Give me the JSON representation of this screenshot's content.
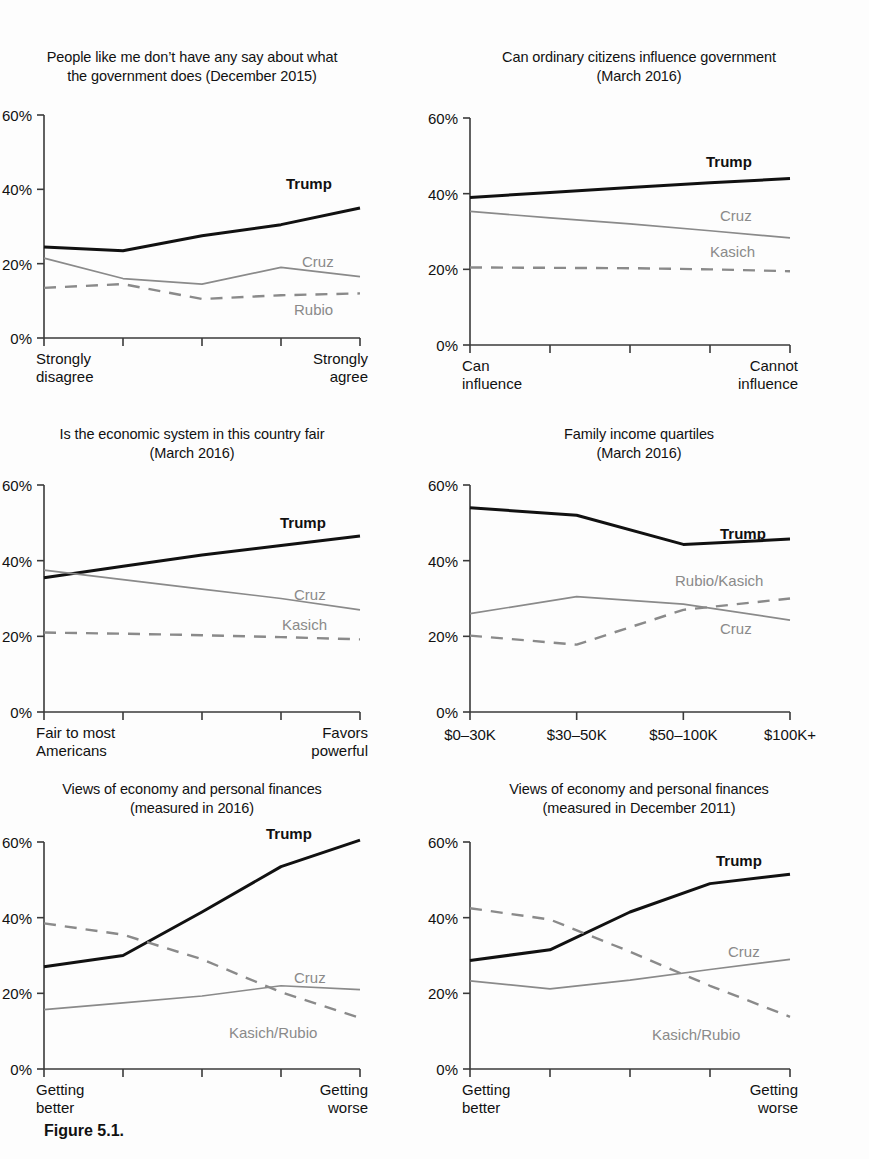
{
  "figure": {
    "caption": "Figure 5.1.",
    "axis": {
      "ticks": [
        "60%",
        "40%",
        "20%",
        "0%"
      ],
      "ymin": 0,
      "ymax": 60
    },
    "colors": {
      "trump": "#111111",
      "gray": "#8a8a8a",
      "axis": "#3a3a3a"
    }
  },
  "chart_data": [
    {
      "id": "panel-say-government",
      "type": "line",
      "title": "People like me don’t have any say about what\nthe government does (December 2015)",
      "xlabel": "",
      "ylabel": "",
      "ylim": [
        0,
        60
      ],
      "ytick_labels": [
        "60%",
        "40%",
        "20%",
        "0%"
      ],
      "ytick_values": [
        60,
        40,
        20,
        0
      ],
      "grid": false,
      "legend_position": "inline-right",
      "x": [
        1,
        2,
        3,
        4,
        5
      ],
      "x_axis_end_labels": {
        "left": "Strongly\ndisagree",
        "right": "Strongly\nagree"
      },
      "series": [
        {
          "name": "Trump",
          "style": "solid-thick",
          "color": "#111111",
          "values": [
            24.5,
            23.5,
            27.5,
            30.5,
            35.0
          ]
        },
        {
          "name": "Cruz",
          "style": "solid-thin",
          "color": "#8a8a8a",
          "values": [
            21.5,
            16.0,
            14.5,
            19.0,
            16.5
          ]
        },
        {
          "name": "Rubio",
          "style": "dashed",
          "color": "#8a8a8a",
          "values": [
            13.5,
            14.5,
            10.5,
            11.5,
            12.0
          ]
        }
      ]
    },
    {
      "id": "panel-ordinary-citizens",
      "type": "line",
      "title": "Can ordinary citizens influence government\n(March 2016)",
      "xlabel": "",
      "ylabel": "",
      "ylim": [
        0,
        60
      ],
      "ytick_labels": [
        "60%",
        "40%",
        "20%",
        "0%"
      ],
      "ytick_values": [
        60,
        40,
        20,
        0
      ],
      "grid": false,
      "legend_position": "inline-right",
      "x": [
        1,
        2,
        3,
        4,
        5
      ],
      "x_axis_end_labels": {
        "left": "Can\ninfluence",
        "right": "Cannot\ninfluence"
      },
      "series": [
        {
          "name": "Trump",
          "style": "solid-thick",
          "color": "#111111",
          "values": [
            39.0,
            40.3,
            41.6,
            42.9,
            44.0
          ]
        },
        {
          "name": "Cruz",
          "style": "solid-thin",
          "color": "#8a8a8a",
          "values": [
            35.3,
            33.6,
            32.0,
            30.2,
            28.3
          ]
        },
        {
          "name": "Kasich",
          "style": "dashed",
          "color": "#8a8a8a",
          "values": [
            20.5,
            20.4,
            20.3,
            20.0,
            19.5
          ]
        }
      ]
    },
    {
      "id": "panel-economic-system-fair",
      "type": "line",
      "title": "Is the economic system in this country fair\n(March 2016)",
      "xlabel": "",
      "ylabel": "",
      "ylim": [
        0,
        60
      ],
      "ytick_labels": [
        "60%",
        "40%",
        "20%",
        "0%"
      ],
      "ytick_values": [
        60,
        40,
        20,
        0
      ],
      "grid": false,
      "legend_position": "inline-right",
      "x": [
        1,
        2,
        3,
        4,
        5
      ],
      "x_axis_end_labels": {
        "left": "Fair to most\nAmericans",
        "right": "Favors\npowerful"
      },
      "series": [
        {
          "name": "Trump",
          "style": "solid-thick",
          "color": "#111111",
          "values": [
            35.5,
            38.5,
            41.5,
            44.0,
            46.5
          ]
        },
        {
          "name": "Cruz",
          "style": "solid-thin",
          "color": "#8a8a8a",
          "values": [
            37.5,
            35.0,
            32.5,
            30.0,
            27.0
          ]
        },
        {
          "name": "Kasich",
          "style": "dashed",
          "color": "#8a8a8a",
          "values": [
            21.0,
            20.7,
            20.3,
            19.8,
            19.2
          ]
        }
      ]
    },
    {
      "id": "panel-family-income",
      "type": "line",
      "title": "Family income quartiles\n(March 2016)",
      "xlabel": "",
      "ylabel": "",
      "ylim": [
        0,
        60
      ],
      "ytick_labels": [
        "60%",
        "40%",
        "20%",
        "0%"
      ],
      "ytick_values": [
        60,
        40,
        20,
        0
      ],
      "grid": false,
      "legend_position": "inline-right",
      "x": [
        1,
        2,
        3,
        4
      ],
      "categories": [
        "$0–30K",
        "$30–50K",
        "$50–100K",
        "$100K+"
      ],
      "series": [
        {
          "name": "Trump",
          "style": "solid-thick",
          "color": "#111111",
          "values": [
            54.0,
            52.0,
            44.3,
            45.7
          ]
        },
        {
          "name": "Rubio/Kasich",
          "style": "solid-thin",
          "color": "#8a8a8a",
          "values": [
            26.0,
            30.5,
            28.5,
            24.3
          ]
        },
        {
          "name": "Cruz",
          "style": "dashed",
          "color": "#8a8a8a",
          "values": [
            20.2,
            17.8,
            27.0,
            30.0
          ]
        }
      ]
    },
    {
      "id": "panel-economy-2016",
      "type": "line",
      "title": "Views of economy and personal finances\n(measured in 2016)",
      "xlabel": "",
      "ylabel": "",
      "ylim": [
        0,
        60
      ],
      "ytick_labels": [
        "60%",
        "40%",
        "20%",
        "0%"
      ],
      "ytick_values": [
        60,
        40,
        20,
        0
      ],
      "grid": false,
      "legend_position": "inline-right",
      "x": [
        1,
        2,
        3,
        4,
        5
      ],
      "x_axis_end_labels": {
        "left": "Getting\nbetter",
        "right": "Getting\nworse"
      },
      "series": [
        {
          "name": "Trump",
          "style": "solid-thick",
          "color": "#111111",
          "values": [
            27.0,
            30.0,
            41.5,
            53.5,
            60.5
          ]
        },
        {
          "name": "Cruz",
          "style": "solid-thin",
          "color": "#8a8a8a",
          "values": [
            15.7,
            17.5,
            19.3,
            22.0,
            21.0
          ]
        },
        {
          "name": "Kasich/Rubio",
          "style": "dashed",
          "color": "#8a8a8a",
          "values": [
            38.5,
            35.5,
            29.0,
            20.3,
            13.5
          ]
        }
      ]
    },
    {
      "id": "panel-economy-2011",
      "type": "line",
      "title": "Views of economy and personal finances\n(measured in December 2011)",
      "xlabel": "",
      "ylabel": "",
      "ylim": [
        0,
        60
      ],
      "ytick_labels": [
        "60%",
        "40%",
        "20%",
        "0%"
      ],
      "ytick_values": [
        60,
        40,
        20,
        0
      ],
      "grid": false,
      "legend_position": "inline-right",
      "x": [
        1,
        2,
        3,
        4,
        5
      ],
      "x_axis_end_labels": {
        "left": "Getting\nbetter",
        "right": "Getting\nworse"
      },
      "series": [
        {
          "name": "Trump",
          "style": "solid-thick",
          "color": "#111111",
          "values": [
            28.7,
            31.5,
            41.5,
            49.0,
            51.5
          ]
        },
        {
          "name": "Cruz",
          "style": "solid-thin",
          "color": "#8a8a8a",
          "values": [
            23.3,
            21.2,
            23.5,
            26.3,
            29.0
          ]
        },
        {
          "name": "Kasich/Rubio",
          "style": "dashed",
          "color": "#8a8a8a",
          "values": [
            42.5,
            39.5,
            31.0,
            22.0,
            13.8
          ]
        }
      ]
    }
  ]
}
